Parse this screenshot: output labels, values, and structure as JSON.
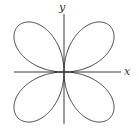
{
  "figure": {
    "type": "polar-curve",
    "equation": "r = sin 2θ",
    "axes": {
      "x_label": "x",
      "y_label": "y"
    },
    "colors": {
      "curve": "#3a3a3a",
      "axes": "#3a3a3a",
      "background": "#ffffff"
    }
  }
}
